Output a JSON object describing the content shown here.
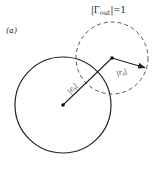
{
  "figure": {
    "panel_label": "(a)",
    "unit_circle_label": {
      "prefix": "|Γ",
      "subscript": "out",
      "suffix": "|=1"
    },
    "center_distance_label": {
      "prefix": "|c",
      "subscript": "s",
      "suffix": "|"
    },
    "radius_label": {
      "prefix": "|r",
      "subscript": "s",
      "suffix": "|"
    }
  },
  "geometry": {
    "solid_circle": {
      "cx": 63,
      "cy": 105,
      "r": 48
    },
    "dashed_circle": {
      "cx": 112,
      "cy": 58,
      "r": 36
    },
    "center_line": {
      "x1": 63,
      "y1": 105,
      "x2": 112,
      "y2": 58
    },
    "radius_arrow": {
      "x1": 112,
      "y1": 58,
      "x2": 146,
      "y2": 68
    }
  },
  "colors": {
    "stroke": "#222222",
    "background": "#ffffff"
  }
}
